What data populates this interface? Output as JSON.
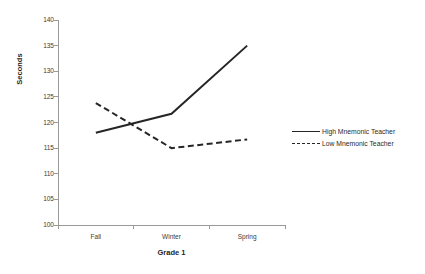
{
  "chart_data": {
    "type": "line",
    "title": "",
    "subtitle": "",
    "xlabel": "Grade 1",
    "ylabel": "Seconds",
    "categories": [
      "Fall",
      "Winter",
      "Spring"
    ],
    "series": [
      {
        "name": "High Mnemonic Teacher",
        "style": "solid",
        "color": "#262626",
        "values": [
          118.0,
          121.7,
          135.0
        ]
      },
      {
        "name": "Low Mnemonic Teacher",
        "style": "dashed",
        "color": "#262626",
        "values": [
          123.8,
          115.0,
          116.7
        ]
      }
    ],
    "ylim": [
      100,
      140
    ],
    "yticks": [
      100,
      105,
      110,
      115,
      120,
      125,
      130,
      135,
      140
    ],
    "ytick_labels": [
      "100",
      "105",
      "110",
      "115",
      "120",
      "125",
      "130",
      "135",
      "140"
    ],
    "grid": false,
    "legend_position": "right",
    "legend_entries": [
      "High Mnemonic Teacher",
      "Low Mnemonic Teacher"
    ],
    "axis_color": "#9a9a9a",
    "background": "#ffffff"
  }
}
